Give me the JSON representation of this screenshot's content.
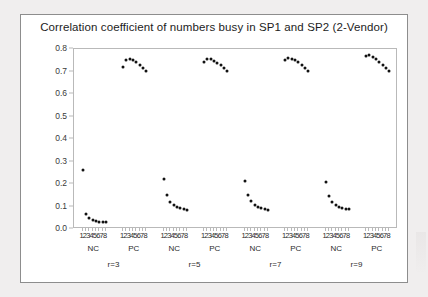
{
  "chart_data": {
    "type": "scatter",
    "title": "Correlation coefficient of numbers busy in SP1 and SP2 (2-Vendor)",
    "xlabel": "",
    "ylabel": "",
    "ylim": [
      0.0,
      0.8
    ],
    "ytick_labels": [
      "0.0",
      "0.1",
      "0.2",
      "0.3",
      "0.4",
      "0.5",
      "0.6",
      "0.7",
      "0.8"
    ],
    "ytick_values": [
      0.0,
      0.1,
      0.2,
      0.3,
      0.4,
      0.5,
      0.6,
      0.7,
      0.8
    ],
    "x_tick_labels": [
      "1",
      "2",
      "3",
      "4",
      "5",
      "6",
      "7",
      "8"
    ],
    "grid": false,
    "legend": "none",
    "group_labels": [
      "r=3",
      "r=5",
      "r=7",
      "r=9"
    ],
    "subgroup_labels": [
      "NC",
      "PC"
    ],
    "series": [
      {
        "name": "r=3 NC",
        "group": "r=3",
        "subgroup": "NC",
        "x": [
          1,
          2,
          3,
          4,
          5,
          6,
          7,
          8
        ],
        "values": [
          0.262,
          0.068,
          0.048,
          0.04,
          0.035,
          0.032,
          0.03,
          0.029
        ]
      },
      {
        "name": "r=3 PC",
        "group": "r=3",
        "subgroup": "PC",
        "x": [
          1,
          2,
          3,
          4,
          5,
          6,
          7,
          8
        ],
        "values": [
          0.722,
          0.752,
          0.755,
          0.751,
          0.742,
          0.731,
          0.717,
          0.702
        ]
      },
      {
        "name": "r=5 NC",
        "group": "r=5",
        "subgroup": "NC",
        "x": [
          1,
          2,
          3,
          4,
          5,
          6,
          7,
          8
        ],
        "values": [
          0.222,
          0.152,
          0.122,
          0.107,
          0.098,
          0.092,
          0.088,
          0.085
        ]
      },
      {
        "name": "r=5 PC",
        "group": "r=5",
        "subgroup": "PC",
        "x": [
          1,
          2,
          3,
          4,
          5,
          6,
          7,
          8
        ],
        "values": [
          0.742,
          0.757,
          0.755,
          0.748,
          0.74,
          0.729,
          0.716,
          0.703
        ]
      },
      {
        "name": "r=7 NC",
        "group": "r=7",
        "subgroup": "NC",
        "x": [
          1,
          2,
          3,
          4,
          5,
          6,
          7,
          8
        ],
        "values": [
          0.215,
          0.15,
          0.123,
          0.108,
          0.099,
          0.093,
          0.089,
          0.086
        ]
      },
      {
        "name": "r=7 PC",
        "group": "r=7",
        "subgroup": "PC",
        "x": [
          1,
          2,
          3,
          4,
          5,
          6,
          7,
          8
        ],
        "values": [
          0.752,
          0.76,
          0.757,
          0.75,
          0.741,
          0.73,
          0.717,
          0.702
        ]
      },
      {
        "name": "r=9 NC",
        "group": "r=9",
        "subgroup": "NC",
        "x": [
          1,
          2,
          3,
          4,
          5,
          6,
          7,
          8
        ],
        "values": [
          0.21,
          0.148,
          0.122,
          0.108,
          0.099,
          0.094,
          0.09,
          0.087
        ]
      },
      {
        "name": "r=9 PC",
        "group": "r=9",
        "subgroup": "PC",
        "x": [
          1,
          2,
          3,
          4,
          5,
          6,
          7,
          8
        ],
        "values": [
          0.768,
          0.772,
          0.765,
          0.755,
          0.744,
          0.731,
          0.716,
          0.701
        ]
      }
    ]
  },
  "chart": {
    "title": "Correlation coefficient of numbers busy in SP1 and SP2 (2-Vendor)",
    "marker_color": "#121212",
    "axis_color": "#b9b9b9",
    "frame_color": "#8d8d8d",
    "background": "#ffffff",
    "page_background": "#f0eeee"
  }
}
